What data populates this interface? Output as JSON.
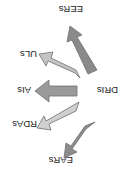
{
  "diagram": {
    "center": {
      "label": "DRIs"
    },
    "branches": [
      {
        "id": "ears",
        "label": "EARs",
        "color": "#8c8c8c"
      },
      {
        "id": "rdas",
        "label": "RDAs",
        "color": "#cfcfcf"
      },
      {
        "id": "ais",
        "label": "AIs",
        "color": "#9a9a9a"
      },
      {
        "id": "uls",
        "label": "ULs",
        "color": "#c4c4c4"
      },
      {
        "id": "eers",
        "label": "EERs",
        "color": "#8a8a8a"
      }
    ],
    "orientation": "rotated-180"
  }
}
